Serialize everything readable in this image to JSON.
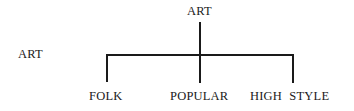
{
  "diagram": {
    "type": "tree",
    "side_label": "ART",
    "root": "ART",
    "children": [
      "FOLK",
      "POPULAR",
      "HIGH STYLE"
    ]
  }
}
